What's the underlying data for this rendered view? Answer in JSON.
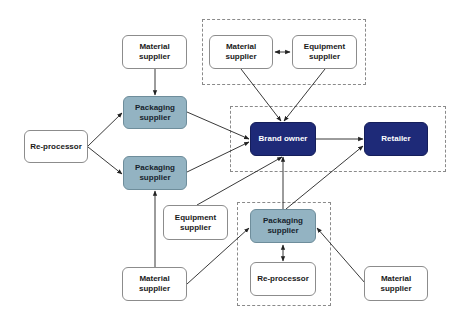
{
  "diagram": {
    "type": "supply-chain-flow",
    "colors": {
      "plain_fill": "#ffffff",
      "packaging_fill": "#93b3c2",
      "brand_fill": "#1e2a78",
      "edge": "#222222",
      "group_border": "#8a8a8a"
    },
    "nodes": {
      "material_supplier_top_left": {
        "label": "Material\nsupplier"
      },
      "packaging_supplier_1": {
        "label": "Packaging\nsupplier"
      },
      "re_processor_left": {
        "label": "Re-processor"
      },
      "packaging_supplier_2": {
        "label": "Packaging\nsupplier"
      },
      "material_supplier_top_group": {
        "label": "Material\nsupplier"
      },
      "equipment_supplier_top_group": {
        "label": "Equipment\nsupplier"
      },
      "brand_owner": {
        "label": "Brand owner"
      },
      "retailer": {
        "label": "Retailer"
      },
      "equipment_supplier_mid": {
        "label": "Equipment\nsupplier"
      },
      "packaging_supplier_3": {
        "label": "Packaging\nsupplier"
      },
      "re_processor_bottom": {
        "label": "Re-processor"
      },
      "material_supplier_bottom_left": {
        "label": "Material\nsupplier"
      },
      "material_supplier_bottom_right": {
        "label": "Material\nsupplier"
      }
    },
    "groups": [
      {
        "id": "top-group",
        "members": [
          "material_supplier_top_group",
          "equipment_supplier_top_group"
        ]
      },
      {
        "id": "brand-group",
        "members": [
          "brand_owner",
          "retailer"
        ]
      },
      {
        "id": "bottom-group",
        "members": [
          "packaging_supplier_3",
          "re_processor_bottom"
        ]
      }
    ],
    "edges": [
      {
        "from": "material_supplier_top_left",
        "to": "packaging_supplier_1"
      },
      {
        "from": "re_processor_left",
        "to": "packaging_supplier_1"
      },
      {
        "from": "re_processor_left",
        "to": "packaging_supplier_2"
      },
      {
        "from": "packaging_supplier_1",
        "to": "brand_owner"
      },
      {
        "from": "packaging_supplier_2",
        "to": "brand_owner"
      },
      {
        "from": "material_supplier_top_group",
        "to": "equipment_supplier_top_group",
        "bidirectional": true
      },
      {
        "from": "material_supplier_top_group",
        "to": "brand_owner"
      },
      {
        "from": "equipment_supplier_top_group",
        "to": "brand_owner"
      },
      {
        "from": "brand_owner",
        "to": "retailer"
      },
      {
        "from": "equipment_supplier_mid",
        "to": "brand_owner"
      },
      {
        "from": "packaging_supplier_3",
        "to": "brand_owner"
      },
      {
        "from": "packaging_supplier_3",
        "to": "retailer"
      },
      {
        "from": "packaging_supplier_3",
        "to": "re_processor_bottom",
        "bidirectional": true
      },
      {
        "from": "material_supplier_bottom_left",
        "to": "packaging_supplier_2"
      },
      {
        "from": "material_supplier_bottom_left",
        "to": "packaging_supplier_3"
      },
      {
        "from": "material_supplier_bottom_right",
        "to": "packaging_supplier_3"
      }
    ]
  }
}
